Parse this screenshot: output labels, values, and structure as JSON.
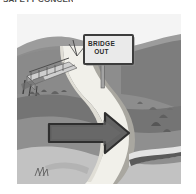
{
  "page": {
    "background_color": "#ffffff",
    "caption_clipped_text": "SAFETY CONCERNS"
  },
  "illustration": {
    "name": "bridge-out-road-illustration",
    "style": "grayscale cartoon landscape drawing",
    "frame": {
      "x": 17,
      "y": 14,
      "width": 164,
      "height": 170
    },
    "sky_color": "#f4f4f4",
    "far_hill_color": "#8e8e8e",
    "mid_hill_color": "#9a9a9a",
    "dark_ridge_color": "#6f6f6f",
    "near_field_color": "#8a8a8a",
    "foreground_color": "#bdbdbd",
    "road_color": "#f0efe9",
    "road_shadow_color": "#b5b3ac",
    "arrow_color": "#5f5f5f",
    "arrow_outline_color": "#3a3a3a",
    "sign_face_color": "#e9e9e9",
    "sign_border_color": "#3d3d3d",
    "sign_post_color": "#9d9d9d",
    "bridge_color": "#cfcfcf",
    "bridge_dark_color": "#4a4a4a",
    "sign": {
      "line1": "BRIDGE",
      "line2": "OUT"
    },
    "elements": [
      "sky",
      "rolling-hills",
      "winding-road",
      "collapsed-bridge",
      "bridge-out-sign",
      "direction-arrow",
      "shrubs",
      "riverbed"
    ]
  }
}
